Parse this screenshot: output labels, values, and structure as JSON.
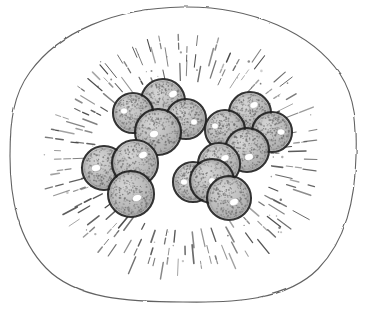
{
  "figure": {
    "kind": "scientific-line-drawing",
    "medium": "pen-and-ink stipple drawing",
    "canvas": {
      "width": 367,
      "height": 313,
      "background": "#ffffff"
    },
    "caption": "",
    "labels": []
  },
  "palette": {
    "paper": "#ffffff",
    "outline_ink": "#4a4a4a",
    "cell_wall_ink": "#555555",
    "hatch_ink": "#3f3f3f",
    "spore_outline": "#1c1c1c",
    "spore_fill": "#b9b9b9",
    "spore_fill_light": "#cfcfcf",
    "stipple_dot": "#6e6e6e",
    "highlight": "#ffffff"
  },
  "cell_wall": {
    "name": "outer-cell-wall",
    "shape": "irregular-rounded-oval",
    "stroke_width": 1.1,
    "center": {
      "x": 183,
      "y": 155
    },
    "radius_x": 172,
    "radius_y": 148,
    "bounds": {
      "left": 10,
      "top": 7,
      "right": 356,
      "bottom": 302
    },
    "path": "M 183 7 C 252 6 312 33 340 74 C 356 98 357 128 356 156 C 355 200 346 240 318 269 C 287 300 236 303 183 302 C 128 302 76 299 46 268 C 18 239 10 199 10 156 C 10 122 13 95 30 72 C 59 32 114 8 183 7 Z"
  },
  "radial_hatching": {
    "name": "radial-hatch-ring",
    "description": "short radial dashes forming a corona ring inside the cell wall",
    "dash_count": 150,
    "dash_length_min": 6,
    "dash_length_max": 19,
    "stroke_width": 1.2,
    "rings": [
      {
        "radius_x": 92,
        "radius_y": 78,
        "count": 50
      },
      {
        "radius_x": 108,
        "radius_y": 92,
        "count": 52
      },
      {
        "radius_x": 124,
        "radius_y": 105,
        "count": 48
      }
    ],
    "center": {
      "x": 183,
      "y": 155
    }
  },
  "spore_clusters": [
    {
      "id": "cluster-upper-left",
      "name": "spore-cluster-upper-left",
      "label": "tetrad",
      "center": {
        "x": 155,
        "y": 117
      },
      "spore_count": 4,
      "spores": [
        {
          "cx": 163,
          "cy": 101,
          "r": 22,
          "highlight": {
            "dx": 10,
            "dy": -7,
            "rx": 4.5,
            "ry": 3.4,
            "angle": -25
          }
        },
        {
          "cx": 133,
          "cy": 113,
          "r": 20,
          "highlight": {
            "dx": -9,
            "dy": -2,
            "rx": 3.6,
            "ry": 3.0,
            "angle": 0
          }
        },
        {
          "cx": 186,
          "cy": 119,
          "r": 20,
          "highlight": {
            "dx": 8,
            "dy": 3,
            "rx": 3.4,
            "ry": 3.0,
            "angle": 0
          }
        },
        {
          "cx": 158,
          "cy": 132,
          "r": 23,
          "highlight": {
            "dx": -4,
            "dy": 2,
            "rx": 4.6,
            "ry": 3.6,
            "angle": -15
          }
        }
      ]
    },
    {
      "id": "cluster-right",
      "name": "spore-cluster-right",
      "label": "tetrad",
      "center": {
        "x": 251,
        "y": 131
      },
      "spore_count": 4,
      "spores": [
        {
          "cx": 250,
          "cy": 113,
          "r": 21,
          "highlight": {
            "dx": 4,
            "dy": -8,
            "rx": 4.2,
            "ry": 3.2,
            "angle": -20
          }
        },
        {
          "cx": 225,
          "cy": 130,
          "r": 20,
          "highlight": {
            "dx": -10,
            "dy": -4,
            "rx": 3.4,
            "ry": 3.0,
            "angle": 0
          }
        },
        {
          "cx": 272,
          "cy": 132,
          "r": 20,
          "highlight": {
            "dx": 9,
            "dy": 0,
            "rx": 3.8,
            "ry": 3.0,
            "angle": 10
          }
        },
        {
          "cx": 247,
          "cy": 150,
          "r": 22,
          "highlight": {
            "dx": 2,
            "dy": 7,
            "rx": 4.4,
            "ry": 3.4,
            "angle": -15
          }
        }
      ]
    },
    {
      "id": "cluster-lower-left",
      "name": "spore-cluster-lower-left",
      "label": "triad",
      "center": {
        "x": 122,
        "y": 176
      },
      "spore_count": 3,
      "spores": [
        {
          "cx": 104,
          "cy": 168,
          "r": 22,
          "highlight": {
            "dx": -8,
            "dy": 0,
            "rx": 4.6,
            "ry": 3.4,
            "angle": -10
          }
        },
        {
          "cx": 135,
          "cy": 163,
          "r": 23,
          "highlight": {
            "dx": 8,
            "dy": -8,
            "rx": 4.6,
            "ry": 3.4,
            "angle": -25
          }
        },
        {
          "cx": 131,
          "cy": 194,
          "r": 23,
          "highlight": {
            "dx": 6,
            "dy": 4,
            "rx": 4.8,
            "ry": 3.4,
            "angle": -20
          }
        }
      ]
    },
    {
      "id": "cluster-lower-center",
      "name": "spore-cluster-lower-center",
      "label": "tetrad",
      "center": {
        "x": 212,
        "y": 185
      },
      "spore_count": 4,
      "spores": [
        {
          "cx": 219,
          "cy": 164,
          "r": 21,
          "highlight": {
            "dx": 6,
            "dy": -6,
            "rx": 4.2,
            "ry": 3.2,
            "angle": -20
          }
        },
        {
          "cx": 193,
          "cy": 182,
          "r": 20,
          "highlight": {
            "dx": -9,
            "dy": 0,
            "rx": 3.6,
            "ry": 3.0,
            "angle": 0
          }
        },
        {
          "cx": 212,
          "cy": 181,
          "r": 22,
          "highlight": {
            "dx": 0,
            "dy": 0,
            "rx": 3.4,
            "ry": 3.4,
            "angle": 0
          }
        },
        {
          "cx": 229,
          "cy": 198,
          "r": 22,
          "highlight": {
            "dx": 5,
            "dy": 4,
            "rx": 4.6,
            "ry": 3.4,
            "angle": -20
          }
        }
      ]
    }
  ],
  "stipple": {
    "name": "spore-stipple-texture",
    "dot_radius": 0.55,
    "density_per_spore": 230
  }
}
